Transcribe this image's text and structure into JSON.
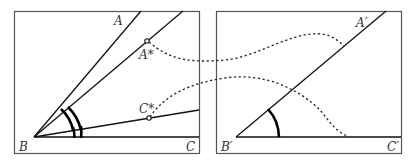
{
  "diagram": {
    "left_panel": {
      "labels": {
        "A": "A",
        "A_star": "A*",
        "C_star": "C*",
        "B": "B",
        "C": "C"
      }
    },
    "right_panel": {
      "labels": {
        "A_prime": "A′",
        "B_prime": "B′",
        "C_prime": "C′"
      }
    },
    "colors": {
      "stroke": "#111111",
      "frame": "#555555",
      "background": "#ffffff"
    }
  }
}
